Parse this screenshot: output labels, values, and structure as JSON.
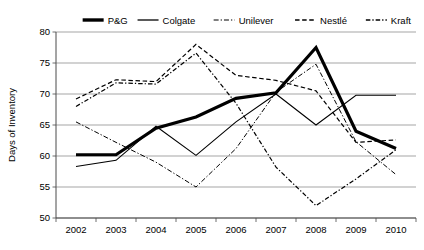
{
  "chart_data": {
    "type": "line",
    "title": "",
    "xlabel": "",
    "ylabel": "Days of Inventory",
    "categories": [
      "2002",
      "2003",
      "2004",
      "2005",
      "2006",
      "2007",
      "2008",
      "2009",
      "2010"
    ],
    "ylim": [
      50,
      80
    ],
    "ytick_labels": [
      "50",
      "55",
      "60",
      "65",
      "70",
      "75",
      "80"
    ],
    "yticks": [
      50,
      55,
      60,
      65,
      70,
      75,
      80
    ],
    "grid": "horizontal",
    "legend_position": "top",
    "series": [
      {
        "name": "P&G",
        "style": "solid-thick",
        "stroke_width": 3.2,
        "dash": "none",
        "values": [
          60.2,
          60.2,
          64.5,
          66.3,
          69.3,
          70.2,
          77.5,
          64.0,
          61.2
        ]
      },
      {
        "name": "Colgate",
        "style": "solid-thin",
        "stroke_width": 1.1,
        "dash": "none",
        "values": [
          58.3,
          59.3,
          64.8,
          60.1,
          65.5,
          70.0,
          65.0,
          69.8,
          69.8
        ]
      },
      {
        "name": "Unilever",
        "style": "dash-dot-light",
        "stroke_width": 1.0,
        "dash": "5,2,1.3,2",
        "values": [
          65.5,
          62.2,
          59.0,
          55.0,
          61.2,
          70.3,
          74.8,
          62.3,
          57.0
        ]
      },
      {
        "name": "Nestlé",
        "style": "dashed",
        "stroke_width": 1.2,
        "dash": "4.5,2.6",
        "values": [
          69.2,
          72.3,
          72.0,
          78.0,
          73.0,
          72.2,
          70.5,
          62.2,
          62.6
        ]
      },
      {
        "name": "Kraft",
        "style": "dash-dot",
        "stroke_width": 1.2,
        "dash": "4.5,2,1.3,2",
        "values": [
          68.0,
          71.8,
          71.6,
          76.6,
          68.5,
          58.2,
          52.0,
          56.3,
          61.0
        ]
      }
    ],
    "legend": [
      {
        "label": "P&G",
        "dash": "none",
        "stroke_width": 3.4
      },
      {
        "label": "Colgate",
        "dash": "none",
        "stroke_width": 1.3
      },
      {
        "label": "Unilever",
        "dash": "5,2,1.3,2",
        "stroke_width": 1.1
      },
      {
        "label": "Nestlé",
        "dash": "4.5,2.6",
        "stroke_width": 1.3
      },
      {
        "label": "Kraft",
        "dash": "4.5,2,1.3,2",
        "stroke_width": 1.3
      }
    ],
    "colors": {
      "line": "#000000",
      "grid": "#808080",
      "axis": "#4a4a4a",
      "background": "#ffffff"
    }
  }
}
